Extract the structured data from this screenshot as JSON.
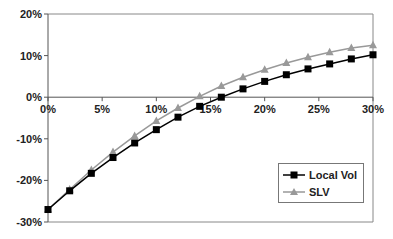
{
  "chart_data": {
    "type": "line",
    "title": "",
    "xlabel": "",
    "ylabel": "",
    "x": [
      0,
      2,
      4,
      6,
      8,
      10,
      12,
      14,
      16,
      18,
      20,
      22,
      24,
      26,
      28,
      30
    ],
    "series": [
      {
        "name": "Local Vol",
        "color": "#000000",
        "marker": "square",
        "values": [
          -27,
          -22.5,
          -18.3,
          -14.5,
          -11,
          -7.8,
          -4.8,
          -2.2,
          0,
          2,
          3.8,
          5.4,
          6.8,
          8,
          9.2,
          10.2
        ]
      },
      {
        "name": "SLV",
        "color": "#999999",
        "marker": "triangle",
        "values": [
          -27,
          -22.2,
          -17.5,
          -13.2,
          -9.3,
          -5.7,
          -2.6,
          0.2,
          2.7,
          4.8,
          6.6,
          8.2,
          9.6,
          10.8,
          11.8,
          12.5
        ]
      }
    ],
    "xlim": [
      0,
      30
    ],
    "ylim": [
      -30,
      20
    ],
    "x_ticks": [
      "0%",
      "5%",
      "10%",
      "15%",
      "20%",
      "25%",
      "30%"
    ],
    "y_ticks": [
      "20%",
      "10%",
      "0%",
      "-10%",
      "-20%",
      "-30%"
    ],
    "grid": false,
    "legend_position": "lower right"
  },
  "legend": {
    "items": [
      "Local Vol",
      "SLV"
    ]
  }
}
